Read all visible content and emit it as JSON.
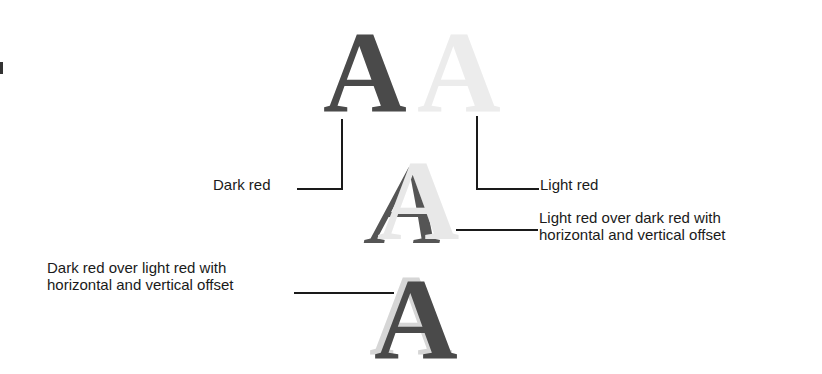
{
  "diagram": {
    "glyph_char": "A",
    "colors": {
      "dark_red": "#4a4a4a",
      "light_red": "#ececec",
      "line": "#1a1a1a"
    },
    "labels": {
      "dark_red": "Dark red",
      "light_red": "Light red",
      "light_over_dark_line1": "Light red over dark red with",
      "light_over_dark_line2": "horizontal and vertical offset",
      "dark_over_light_line1": "Dark red over light red with",
      "dark_over_light_line2": "horizontal and vertical offset"
    }
  }
}
